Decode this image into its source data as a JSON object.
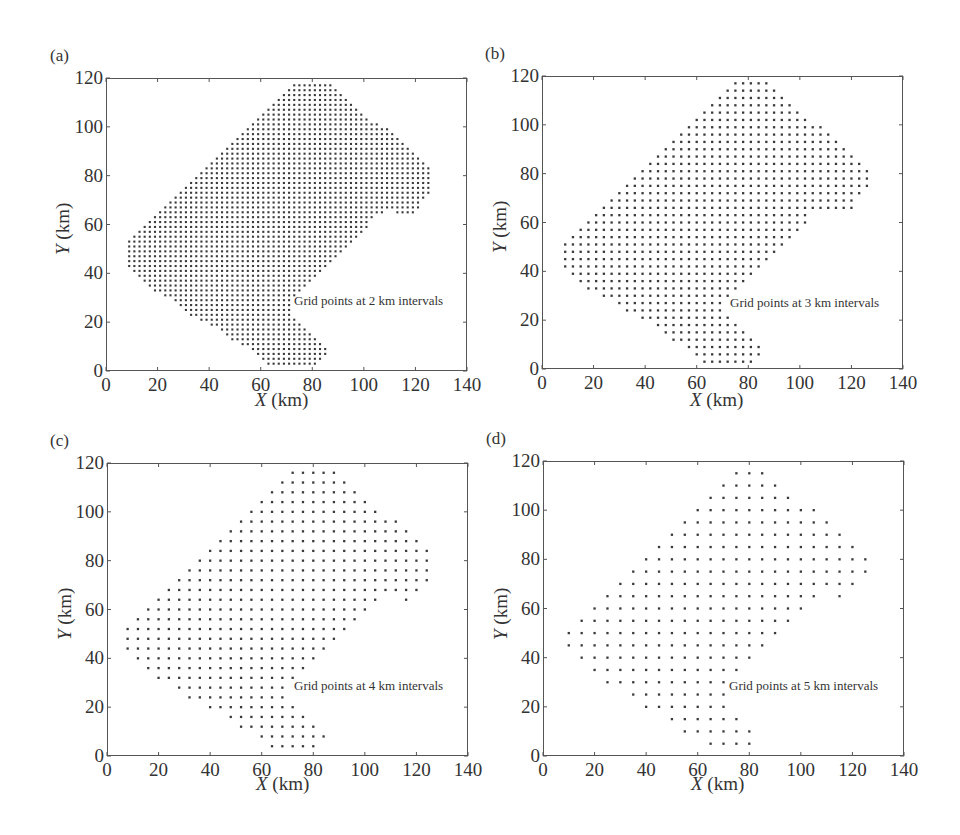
{
  "chart_data": [
    {
      "type": "scatter",
      "panel_label": "(a)",
      "title": "",
      "annotation": "Grid points at 2 km intervals",
      "interval_km": 2,
      "xlabel_var": "X",
      "xlabel_unit": " (km)",
      "ylabel_var": "Y",
      "ylabel_unit": " (km)",
      "xlim": [
        0,
        140
      ],
      "ylim": [
        0,
        120
      ],
      "xticks": [
        0,
        20,
        40,
        60,
        80,
        100,
        120,
        140
      ],
      "yticks": [
        0,
        20,
        40,
        60,
        80,
        100,
        120
      ],
      "grid": false,
      "grid_offset_km": [
        1,
        1
      ]
    },
    {
      "type": "scatter",
      "panel_label": "(b)",
      "title": "",
      "annotation": "Grid points at 3 km intervals",
      "interval_km": 3,
      "xlabel_var": "X",
      "xlabel_unit": " (km)",
      "ylabel_var": "Y",
      "ylabel_unit": " (km)",
      "xlim": [
        0,
        140
      ],
      "ylim": [
        0,
        120
      ],
      "xticks": [
        0,
        20,
        40,
        60,
        80,
        100,
        120,
        140
      ],
      "yticks": [
        0,
        20,
        40,
        60,
        80,
        100,
        120
      ],
      "grid": false,
      "grid_offset_km": [
        0,
        0
      ]
    },
    {
      "type": "scatter",
      "panel_label": "(c)",
      "title": "",
      "annotation": "Grid points at 4 km intervals",
      "interval_km": 4,
      "xlabel_var": "X",
      "xlabel_unit": " (km)",
      "ylabel_var": "Y",
      "ylabel_unit": " (km)",
      "xlim": [
        0,
        140
      ],
      "ylim": [
        0,
        120
      ],
      "xticks": [
        0,
        20,
        40,
        60,
        80,
        100,
        120,
        140
      ],
      "yticks": [
        0,
        20,
        40,
        60,
        80,
        100,
        120
      ],
      "grid": false,
      "grid_offset_km": [
        0,
        0
      ]
    },
    {
      "type": "scatter",
      "panel_label": "(d)",
      "title": "",
      "annotation": "Grid points at 5 km intervals",
      "interval_km": 5,
      "xlabel_var": "X",
      "xlabel_unit": " (km)",
      "ylabel_var": "Y",
      "ylabel_unit": " (km)",
      "xlim": [
        0,
        140
      ],
      "ylim": [
        0,
        120
      ],
      "xticks": [
        0,
        20,
        40,
        60,
        80,
        100,
        120,
        140
      ],
      "yticks": [
        0,
        20,
        40,
        60,
        80,
        100,
        120
      ],
      "grid": false,
      "grid_offset_km": [
        0,
        0
      ]
    }
  ],
  "region_polygon_km": [
    [
      73,
      118
    ],
    [
      87,
      118
    ],
    [
      92,
      113
    ],
    [
      97,
      108
    ],
    [
      102,
      103
    ],
    [
      112,
      98
    ],
    [
      117,
      93
    ],
    [
      122,
      88
    ],
    [
      127,
      83
    ],
    [
      127,
      73
    ],
    [
      122,
      68
    ],
    [
      118,
      63
    ],
    [
      110,
      66
    ],
    [
      104,
      63
    ],
    [
      101,
      58
    ],
    [
      96,
      53
    ],
    [
      91,
      48
    ],
    [
      86,
      43
    ],
    [
      81,
      38
    ],
    [
      76,
      33
    ],
    [
      71,
      28
    ],
    [
      72,
      23
    ],
    [
      77,
      18
    ],
    [
      82,
      13
    ],
    [
      87,
      8
    ],
    [
      82,
      3
    ],
    [
      63,
      3
    ],
    [
      58,
      8
    ],
    [
      48,
      13
    ],
    [
      43,
      18
    ],
    [
      33,
      23
    ],
    [
      28,
      28
    ],
    [
      18,
      33
    ],
    [
      13,
      38
    ],
    [
      8,
      43
    ],
    [
      8,
      52
    ],
    [
      13,
      57
    ],
    [
      18,
      62
    ],
    [
      23,
      67
    ],
    [
      28,
      72
    ],
    [
      33,
      77
    ],
    [
      38,
      82
    ],
    [
      43,
      87
    ],
    [
      48,
      92
    ],
    [
      53,
      97
    ],
    [
      58,
      102
    ],
    [
      63,
      107
    ],
    [
      68,
      112
    ]
  ],
  "region_note": "Approximate study-area boundary traced by eye from panel (d). Rendered dots are generated by filling this polygon at each panel's interval, so individual points approximate the original rather than transcribing it point-for-point.",
  "style": {
    "point_color": "#3a3a3a",
    "axis_color": "#555555",
    "text_color": "#333333"
  }
}
